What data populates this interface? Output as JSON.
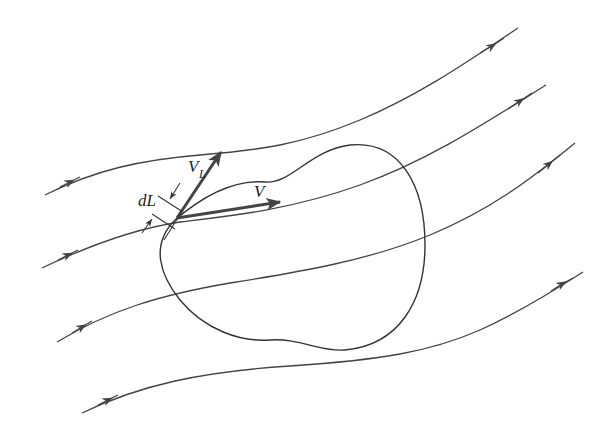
{
  "diagram": {
    "labels": {
      "velocity": "V",
      "tangential_component_main": "V",
      "tangential_component_sub": "L",
      "line_element": "dL"
    },
    "streamline_count": 4,
    "colors": {
      "line": "#444444",
      "background": "#ffffff"
    }
  }
}
